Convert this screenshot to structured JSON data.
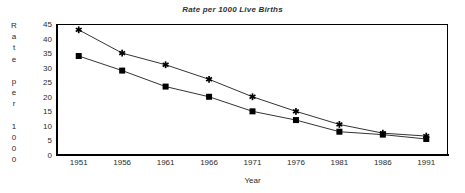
{
  "chart_data": {
    "type": "line",
    "title": "Rate per 1000 Live Births",
    "xlabel": "Year",
    "ylabel": "Rate per 1000",
    "ylabel_stacked": "R\na\nt\ne\n\np\ne\nr\n\n1\n0\n0\n0",
    "categories": [
      1951,
      1956,
      1961,
      1966,
      1971,
      1976,
      1981,
      1986,
      1991
    ],
    "xtick_labels": [
      "1951",
      "1956",
      "1961",
      "1966",
      "1971",
      "1976",
      "1981",
      "1986",
      "1991"
    ],
    "ytick_labels": [
      "45",
      "40",
      "35",
      "30",
      "25",
      "20",
      "15",
      "10",
      "5",
      "0"
    ],
    "yticks": [
      45,
      40,
      35,
      30,
      25,
      20,
      15,
      10,
      5,
      0
    ],
    "ylim": [
      0,
      45
    ],
    "grid": false,
    "legend": "none",
    "series": [
      {
        "name": "upper-series",
        "marker": "star",
        "color": "#000000",
        "values": [
          43,
          35,
          31,
          26,
          20,
          15,
          10.5,
          7.5,
          6.5
        ]
      },
      {
        "name": "lower-series",
        "marker": "square",
        "color": "#000000",
        "values": [
          34,
          29,
          23.5,
          20,
          15,
          12,
          8,
          7,
          5.5
        ]
      }
    ]
  }
}
